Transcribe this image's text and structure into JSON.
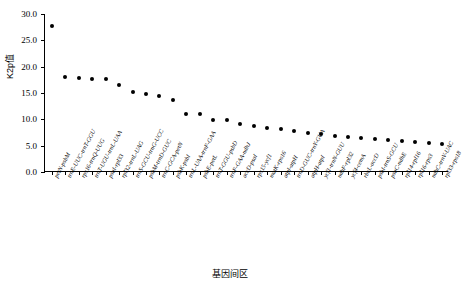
{
  "chart_data": {
    "type": "scatter",
    "title": "",
    "xlabel": "基因间区",
    "ylabel": "K2p值",
    "ylim": [
      0.0,
      30.0
    ],
    "ytick_labels": [
      "0.0",
      "5.0",
      "10.0",
      "15.0",
      "20.0",
      "25.0",
      "30.0"
    ],
    "ytick_values": [
      0.0,
      5.0,
      10.0,
      15.0,
      20.0,
      25.0,
      30.0
    ],
    "grid": false,
    "legend": null,
    "marker": "filled-circle",
    "marker_color": "#000000",
    "categories": [
      "petN-psbM",
      "trnE-UUC-trnT-GGU",
      "rps16-trnQ-UUG",
      "trnT-UGU-trnL-UAA",
      "psaI-rpl33",
      "rpl32-trnL-UAG",
      "trnS-GCU-trnG-UCC",
      "psbM-trnD-GUC",
      "trnC-GCA-petN",
      "psbK-psbI",
      "trnL-UAA-trnF-GAA",
      "psbE-petL",
      "trnT-GGU-psbD",
      "trnF-GAA-ndhJ",
      "accD-psaI",
      "rps15-ycf1",
      "matK-rps16",
      "atpI-atpH",
      "trnD-GUC-trnY-GUA",
      "atpH-atpI",
      "ycf1-trnN-GUU",
      "ndhF-rpl32",
      "ycf4-cemA",
      "rbcL-accD",
      "psbI-trnS-GCU",
      "psaC-ndhE",
      "rpl14-rpl16",
      "rpl16-rps3",
      "ndhC-trnV-UAC",
      "rpl33-rps18"
    ],
    "values": [
      27.8,
      18.0,
      17.8,
      17.7,
      17.6,
      16.6,
      15.2,
      14.8,
      14.4,
      13.6,
      11.1,
      11.0,
      9.9,
      9.8,
      9.2,
      8.7,
      8.4,
      8.1,
      7.8,
      7.5,
      7.2,
      6.9,
      6.7,
      6.5,
      6.2,
      6.0,
      5.9,
      5.7,
      5.5,
      5.3
    ]
  }
}
